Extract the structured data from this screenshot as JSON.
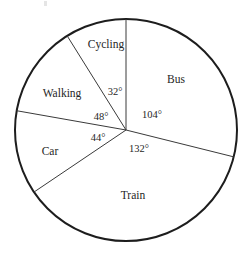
{
  "chart_data": {
    "type": "pie",
    "title": "",
    "subtitle": "",
    "xlabel": "",
    "ylabel": "",
    "legend": "none",
    "grid": false,
    "units": "degrees",
    "total_degrees": 360,
    "start_angle_deg": 0,
    "direction": "clockwise",
    "categories": [
      "Bus",
      "Train",
      "Car",
      "Walking",
      "Cycling"
    ],
    "values": [
      104,
      132,
      44,
      48,
      32
    ],
    "slices": [
      {
        "label": "Bus",
        "angle_label": "104°",
        "degrees": 104,
        "start_deg": 0,
        "end_deg": 104,
        "label_x": 176,
        "label_y": 80,
        "angle_x": 152,
        "angle_y": 116
      },
      {
        "label": "Train",
        "angle_label": "132°",
        "degrees": 132,
        "start_deg": 104,
        "end_deg": 236,
        "label_x": 133,
        "label_y": 196,
        "angle_x": 139,
        "angle_y": 150
      },
      {
        "label": "Car",
        "angle_label": "44°",
        "degrees": 44,
        "start_deg": 236,
        "end_deg": 280,
        "label_x": 50,
        "label_y": 152,
        "angle_x": 98,
        "angle_y": 139
      },
      {
        "label": "Walking",
        "angle_label": "48°",
        "degrees": 48,
        "start_deg": 280,
        "end_deg": 328,
        "label_x": 62,
        "label_y": 94,
        "angle_x": 101,
        "angle_y": 118
      },
      {
        "label": "Cycling",
        "angle_label": "32°",
        "degrees": 32,
        "start_deg": 328,
        "end_deg": 360,
        "label_x": 106,
        "label_y": 45,
        "angle_x": 115,
        "angle_y": 93
      }
    ],
    "geometry": {
      "center_x": 126,
      "center_y": 130,
      "radius": 111
    },
    "colors": {
      "outline": "#1d1d1d",
      "radius_line": "#3a3a3a",
      "fill": "#ffffff",
      "text": "#262626"
    }
  }
}
